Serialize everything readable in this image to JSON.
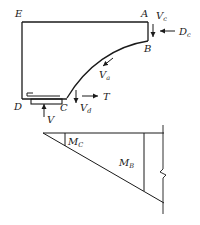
{
  "diagram": {
    "type": "structural free-body and moment diagram",
    "colors": {
      "line": "#1a1a1a",
      "background": "#ffffff"
    },
    "points": {
      "E": {
        "label": "E"
      },
      "A": {
        "label": "A"
      },
      "B": {
        "label": "B"
      },
      "C": {
        "label": "C"
      },
      "D": {
        "label": "D"
      }
    },
    "forces": {
      "Vc": {
        "main": "V",
        "sub": "c"
      },
      "Dc": {
        "main": "D",
        "sub": "c"
      },
      "Va": {
        "main": "V",
        "sub": "a"
      },
      "Vd": {
        "main": "V",
        "sub": "d"
      },
      "T": {
        "main": "T"
      },
      "V": {
        "main": "V"
      }
    },
    "moments": {
      "MC": {
        "main": "M",
        "sub": "C"
      },
      "MB": {
        "main": "M",
        "sub": "B"
      }
    }
  }
}
